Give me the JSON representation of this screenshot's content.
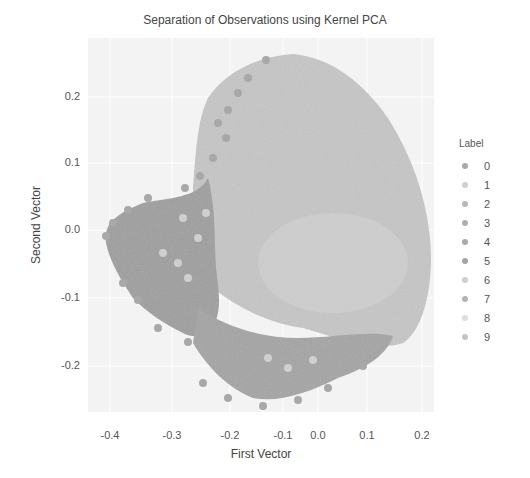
{
  "chart_data": {
    "type": "scatter",
    "title": "Separation of Observations using Kernel PCA",
    "xlabel": "First Vector",
    "ylabel": "Second Vector",
    "xlim": [
      -0.44,
      0.23
    ],
    "ylim": [
      -0.27,
      0.28
    ],
    "x_ticks": [
      "-0.4",
      "-0.3",
      "-0.2",
      "-0.1",
      "0.0",
      "0.1",
      "0.2"
    ],
    "y_ticks": [
      "0.2",
      "0.1",
      "0.0",
      "-0.1",
      "-0.2"
    ],
    "grid": true,
    "background": "#f3f3f3",
    "legend": {
      "title": "Label",
      "position": "right",
      "entries": [
        {
          "label": "0",
          "color": "#a9a9a9"
        },
        {
          "label": "1",
          "color": "#d0d0d0"
        },
        {
          "label": "2",
          "color": "#b8b8b8"
        },
        {
          "label": "3",
          "color": "#b0b0b0"
        },
        {
          "label": "4",
          "color": "#aaaaaa"
        },
        {
          "label": "5",
          "color": "#a4a4a4"
        },
        {
          "label": "6",
          "color": "#cfcfcf"
        },
        {
          "label": "7",
          "color": "#b4b4b4"
        },
        {
          "label": "8",
          "color": "#dedede"
        },
        {
          "label": "9",
          "color": "#c4c4c4"
        }
      ]
    },
    "clusters": [
      {
        "label": "main body (mixed labels 1,2,3,6,7,8,9)",
        "x_range": [
          -0.2,
          0.18
        ],
        "y_range": [
          -0.15,
          0.25
        ],
        "color": "#c2c2c2"
      },
      {
        "label": "left lobe (labels 0,4,5)",
        "x_range": [
          -0.43,
          -0.2
        ],
        "y_range": [
          -0.22,
          0.05
        ],
        "color": "#a0a0a0"
      },
      {
        "label": "bottom band (labels 0,4,5)",
        "x_range": [
          -0.2,
          0.1
        ],
        "y_range": [
          -0.25,
          -0.12
        ],
        "color": "#a6a6a6"
      }
    ]
  },
  "title": "Separation of Observations using Kernel PCA",
  "axes": {
    "xlabel": "First Vector",
    "ylabel": "Second Vector",
    "xticks": [
      {
        "label": "-0.4",
        "px": 22
      },
      {
        "label": "-0.3",
        "px": 84
      },
      {
        "label": "-0.2",
        "px": 142
      },
      {
        "label": "-0.1",
        "px": 195
      },
      {
        "label": "0.0",
        "px": 230
      },
      {
        "label": "0.1",
        "px": 279
      },
      {
        "label": "0.2",
        "px": 334
      }
    ],
    "yticks": [
      {
        "label": "0.2",
        "py": 59
      },
      {
        "label": "0.1",
        "py": 125
      },
      {
        "label": "0.0",
        "py": 192
      },
      {
        "label": "-0.1",
        "py": 260
      },
      {
        "label": "-0.2",
        "py": 328
      }
    ]
  },
  "legend": {
    "title": "Label",
    "items": [
      {
        "label": "0",
        "color": "#a9a9a9"
      },
      {
        "label": "1",
        "color": "#d0d0d0"
      },
      {
        "label": "2",
        "color": "#b8b8b8"
      },
      {
        "label": "3",
        "color": "#b0b0b0"
      },
      {
        "label": "4",
        "color": "#aaaaaa"
      },
      {
        "label": "5",
        "color": "#a4a4a4"
      },
      {
        "label": "6",
        "color": "#cfcfcf"
      },
      {
        "label": "7",
        "color": "#b4b4b4"
      },
      {
        "label": "8",
        "color": "#dedede"
      },
      {
        "label": "9",
        "color": "#c4c4c4"
      }
    ]
  }
}
